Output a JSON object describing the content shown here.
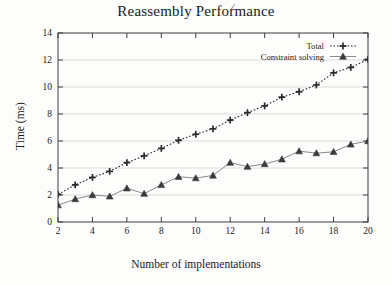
{
  "chart_data": {
    "type": "line",
    "title": "Reassembly Performance",
    "xlabel": "Number of implementations",
    "ylabel": "Time (ms)",
    "xlim": [
      2,
      20
    ],
    "ylim": [
      0,
      14
    ],
    "xticks": [
      2,
      4,
      6,
      8,
      10,
      12,
      14,
      16,
      18,
      20
    ],
    "yticks": [
      0,
      2,
      4,
      6,
      8,
      10,
      12,
      14
    ],
    "grid": "horizontal",
    "legend_position": "top-right",
    "x": [
      2,
      3,
      4,
      5,
      6,
      7,
      8,
      9,
      10,
      11,
      12,
      13,
      14,
      15,
      16,
      17,
      18,
      19,
      20
    ],
    "series": [
      {
        "name": "Total",
        "marker": "plus",
        "linestyle": "dotted",
        "color": "#2b2b2b",
        "values": [
          2.05,
          2.75,
          3.3,
          3.75,
          4.4,
          4.9,
          5.45,
          6.05,
          6.5,
          6.9,
          7.55,
          8.1,
          8.6,
          9.25,
          9.65,
          10.15,
          11.05,
          11.45,
          12.05
        ]
      },
      {
        "name": "Constraint solving",
        "marker": "triangle",
        "linestyle": "solid",
        "color": "#3a3a3a",
        "values": [
          1.25,
          1.7,
          2.0,
          1.9,
          2.5,
          2.1,
          2.75,
          3.35,
          3.25,
          3.45,
          4.4,
          4.1,
          4.3,
          4.65,
          5.25,
          5.1,
          5.2,
          5.75,
          6.0
        ]
      }
    ]
  },
  "legend": {
    "entries": [
      {
        "label": "Total"
      },
      {
        "label": "Constraint solving"
      }
    ]
  },
  "colors": {
    "axis": "#3c3c3c",
    "grid": "#d2d2d2",
    "text": "#1b1b1b",
    "background": "#fdfdfc"
  }
}
